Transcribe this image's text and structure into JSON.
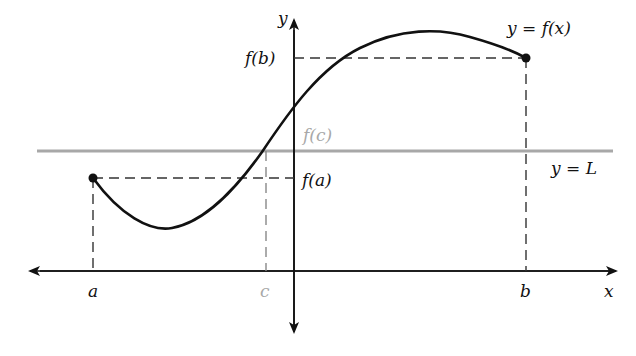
{
  "figure": {
    "axes": {
      "x_label": "x",
      "y_label": "y"
    },
    "curve_label": "y = f(x)",
    "line_label": "y = L",
    "points": {
      "a": {
        "x_label": "a",
        "y_label": "f(a)"
      },
      "b": {
        "x_label": "b",
        "y_label": "f(b)"
      },
      "c": {
        "x_label": "c",
        "y_label": "f(c)"
      }
    },
    "colors": {
      "curve": "#111111",
      "horizontal_line_L": "#a8a8a8",
      "c_marker": "#a8a8a8",
      "axes": "#111111"
    }
  }
}
